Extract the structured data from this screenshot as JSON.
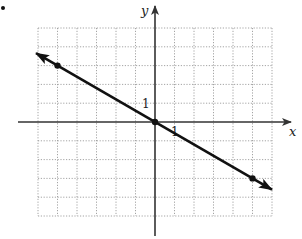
{
  "chart_data": {
    "type": "line",
    "title": "",
    "xlabel": "x",
    "ylabel": "y",
    "xlim": [
      -6,
      6
    ],
    "ylim": [
      -5,
      5
    ],
    "grid": true,
    "grid_style": "dotted",
    "tick_labels": {
      "x": [
        {
          "value": 1,
          "label": "1"
        }
      ],
      "y": [
        {
          "value": 1,
          "label": "1"
        }
      ]
    },
    "series": [
      {
        "name": "line",
        "equation": "y = -3/5 x",
        "slope": -0.6,
        "intercept": 0,
        "arrows_both_ends": true,
        "x": [
          -5,
          0,
          5
        ],
        "y": [
          3,
          0,
          -3
        ],
        "marked_points": [
          {
            "x": -5,
            "y": 3
          },
          {
            "x": 0,
            "y": 0
          },
          {
            "x": 5,
            "y": -3
          }
        ]
      }
    ],
    "legend": null
  },
  "labels": {
    "x_axis": "x",
    "y_axis": "y",
    "x_tick_one": "1",
    "y_tick_one": "1"
  },
  "colors": {
    "axis": "#333333",
    "grid": "#9a9a9a",
    "line": "#111111",
    "background": "#ffffff"
  }
}
